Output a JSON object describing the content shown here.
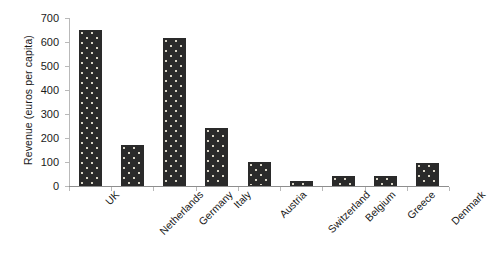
{
  "chart_data": {
    "type": "bar",
    "title": "",
    "subtitle": "",
    "xlabel": "",
    "ylabel": "Revenue (euros per capita)",
    "categories": [
      "UK",
      "Netherlands",
      "Germany",
      "Italy",
      "Austria",
      "Switzerland",
      "Belgium",
      "Greece",
      "Denmark"
    ],
    "values": [
      648,
      170,
      615,
      240,
      100,
      20,
      42,
      42,
      95
    ],
    "series": [
      {
        "name": "Revenue",
        "values": [
          648,
          170,
          615,
          240,
          100,
          20,
          42,
          42,
          95
        ]
      }
    ],
    "ylim": [
      0,
      700
    ],
    "ytick_labels": [
      "700",
      "600",
      "500",
      "400",
      "300",
      "200",
      "100",
      "0"
    ],
    "ytick_values": [
      700,
      600,
      500,
      400,
      300,
      200,
      100,
      0
    ],
    "ytick_step": 100,
    "grid": false,
    "legend": false,
    "legend_position": "none",
    "bar_color": "#2a2a2a",
    "bar_pattern": "dotted-fill",
    "bar_pattern_color": "#d8d4c6",
    "axis_color": "#8e8e8e",
    "text_color": "#1a1a1a",
    "background_color": "#ffffff",
    "xtick_label_rotation": -45,
    "annotations": []
  }
}
